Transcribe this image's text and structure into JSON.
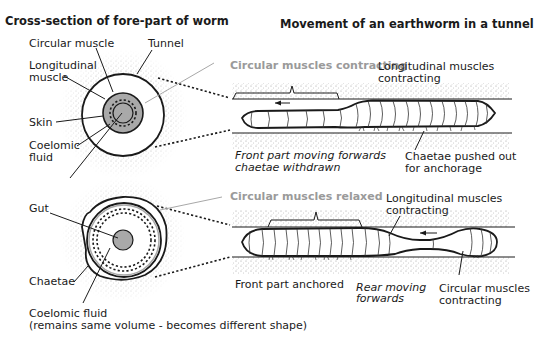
{
  "titles": {
    "left": "Cross-section of fore-part of worm",
    "right": "Movement of an earthworm in a tunnel"
  },
  "cross_section_top": {
    "labels": {
      "circular_muscle": "Circular muscle",
      "tunnel": "Tunnel",
      "longitudinal_1": "Longitudinal",
      "longitudinal_2": "muscle",
      "skin": "Skin",
      "coelomic_1": "Coelomic",
      "coelomic_2": "fluid"
    }
  },
  "cross_section_bottom": {
    "labels": {
      "gut": "Gut",
      "chaetae": "Chaetae",
      "coelomic_fluid": "Coelomic fluid",
      "note": "(remains same volume - becomes different shape)"
    }
  },
  "movement_top": {
    "gray_label": "Circular muscles contracting",
    "longitudinal_1": "Longitudinal muscles",
    "longitudinal_2": "contracting",
    "front_1": "Front part moving forwards",
    "front_2": "chaetae withdrawn",
    "chaetae_1": "Chaetae pushed out",
    "chaetae_2": "for anchorage",
    "arrow_direction": "left"
  },
  "movement_bottom": {
    "gray_label": "Circular muscles relaxed",
    "longitudinal_1": "Longitudinal muscles",
    "longitudinal_2": "contracting",
    "front": "Front part anchored",
    "rear_1": "Rear moving",
    "rear_2": "forwards",
    "circular_1": "Circular muscles",
    "circular_2": "contracting",
    "arrow_direction": "left"
  },
  "colors": {
    "ink": "#1a1a1a",
    "gray_label": "#9a9a9a",
    "muscle_fill": "#a9a9a9",
    "soil_stipple": "#bdbdbd"
  }
}
